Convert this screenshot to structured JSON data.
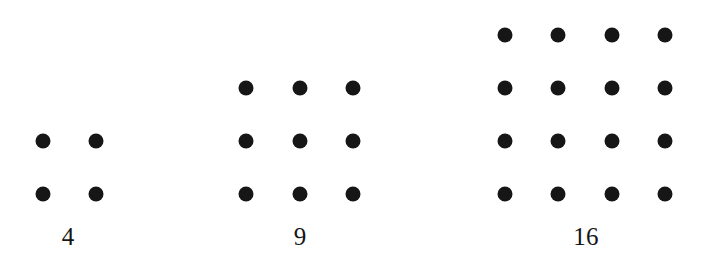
{
  "figure": {
    "background_color": "#ffffff",
    "dot_color": "#161616",
    "label_color": "#151515",
    "dot_diameter_px": 15,
    "grid_spacing_px": 53,
    "baseline_row_y_px": 194
  },
  "chart_data": {
    "type": "scatter",
    "title": "",
    "subtitle": "",
    "xlabel": "",
    "ylabel": "",
    "grid": false,
    "legend_position": "none",
    "xlim": [
      0,
      715
    ],
    "ylim": [
      263,
      0
    ],
    "groups": [
      {
        "name": "square-2x2",
        "label": "4",
        "rows": 2,
        "columns": 4,
        "dot_count": 4,
        "side_length": 2,
        "value": 4,
        "label_x": 68,
        "label_y": 224,
        "column_x": [
          43,
          96
        ],
        "row_y": [
          141,
          194
        ],
        "points": [
          {
            "x": 43,
            "y": 141
          },
          {
            "x": 96,
            "y": 141
          },
          {
            "x": 43,
            "y": 194
          },
          {
            "x": 96,
            "y": 194
          }
        ]
      },
      {
        "name": "square-3x3",
        "label": "9",
        "rows": 3,
        "columns": 3,
        "dot_count": 9,
        "side_length": 3,
        "value": 9,
        "label_x": 300,
        "label_y": 224,
        "column_x": [
          246,
          300,
          353
        ],
        "row_y": [
          88,
          141,
          194
        ],
        "points": [
          {
            "x": 246,
            "y": 88
          },
          {
            "x": 300,
            "y": 88
          },
          {
            "x": 353,
            "y": 88
          },
          {
            "x": 246,
            "y": 141
          },
          {
            "x": 300,
            "y": 141
          },
          {
            "x": 353,
            "y": 141
          },
          {
            "x": 246,
            "y": 194
          },
          {
            "x": 300,
            "y": 194
          },
          {
            "x": 353,
            "y": 194
          }
        ]
      },
      {
        "name": "square-4x4",
        "label": "16",
        "rows": 4,
        "columns": 4,
        "dot_count": 16,
        "side_length": 4,
        "value": 16,
        "label_x": 586,
        "label_y": 224,
        "column_x": [
          505,
          558,
          612,
          665
        ],
        "row_y": [
          35,
          88,
          141,
          194
        ],
        "points": [
          {
            "x": 505,
            "y": 35
          },
          {
            "x": 558,
            "y": 35
          },
          {
            "x": 612,
            "y": 35
          },
          {
            "x": 665,
            "y": 35
          },
          {
            "x": 505,
            "y": 88
          },
          {
            "x": 558,
            "y": 88
          },
          {
            "x": 612,
            "y": 88
          },
          {
            "x": 665,
            "y": 88
          },
          {
            "x": 505,
            "y": 141
          },
          {
            "x": 558,
            "y": 141
          },
          {
            "x": 612,
            "y": 141
          },
          {
            "x": 665,
            "y": 141
          },
          {
            "x": 505,
            "y": 194
          },
          {
            "x": 558,
            "y": 194
          },
          {
            "x": 612,
            "y": 194
          },
          {
            "x": 665,
            "y": 194
          }
        ]
      }
    ],
    "categories": [
      "4",
      "9",
      "16"
    ],
    "values": [
      4,
      9,
      16
    ]
  }
}
